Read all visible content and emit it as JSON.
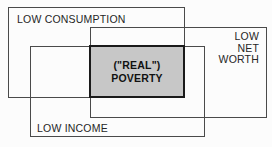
{
  "figure": {
    "type": "venn-rectangle-diagram",
    "background": "#fcfcfc",
    "line_color": "#4a4a4a",
    "text_color": "#262626",
    "sets": [
      {
        "id": "low-consumption",
        "label": "LOW CONSUMPTION"
      },
      {
        "id": "low-net-worth",
        "lines": [
          "LOW",
          "NET",
          "WORTH"
        ]
      },
      {
        "id": "low-income",
        "label": "LOW INCOME"
      }
    ],
    "intersection": {
      "id": "real-poverty",
      "lines": [
        "(\"REAL\")",
        "POVERTY"
      ],
      "fill": "#c7c7c7",
      "border_color": "#1a1a1a"
    }
  }
}
